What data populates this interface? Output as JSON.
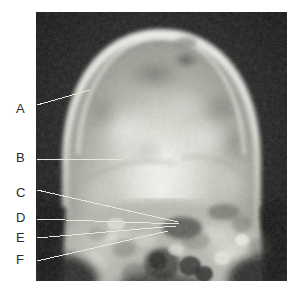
{
  "figure": {
    "type": "radiograph",
    "view": "anteroposterior-skull",
    "caption": "",
    "canvas": {
      "width": 297,
      "height": 291,
      "background": "#ffffff"
    },
    "plate": {
      "x": 36,
      "y": 12,
      "width": 251,
      "height": 269,
      "background": "#0a0a0a"
    }
  },
  "labels": [
    {
      "key": "A",
      "text": "A",
      "x": 16,
      "y": 102,
      "leader": {
        "x1": 37,
        "y1": 105,
        "x2": 90,
        "y2": 90
      }
    },
    {
      "key": "B",
      "text": "B",
      "x": 16,
      "y": 151,
      "leader": {
        "x1": 37,
        "y1": 159,
        "x2": 122,
        "y2": 159
      }
    },
    {
      "key": "C",
      "text": "C",
      "x": 16,
      "y": 186,
      "leader": {
        "x1": 37,
        "y1": 190,
        "x2": 178,
        "y2": 222
      }
    },
    {
      "key": "D",
      "text": "D",
      "x": 16,
      "y": 211,
      "leader": {
        "x1": 37,
        "y1": 219,
        "x2": 179,
        "y2": 224
      }
    },
    {
      "key": "E",
      "text": "E",
      "x": 16,
      "y": 231,
      "leader": {
        "x1": 37,
        "y1": 238,
        "x2": 176,
        "y2": 226
      }
    },
    {
      "key": "F",
      "text": "F",
      "x": 16,
      "y": 253,
      "leader": {
        "x1": 37,
        "y1": 261,
        "x2": 168,
        "y2": 231
      }
    }
  ],
  "style": {
    "label_color": "#2b2b2b",
    "leader_color": "#e8e8e0",
    "leader_width": 1
  }
}
